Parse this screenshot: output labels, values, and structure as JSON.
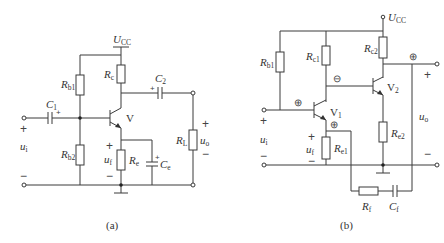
{
  "figure_a": {
    "caption": "(a)",
    "supply": {
      "main": "U",
      "sub": "CC"
    },
    "transistor": "V",
    "resistors": {
      "rb1": {
        "main": "R",
        "sub": "b1"
      },
      "rb2": {
        "main": "R",
        "sub": "b2"
      },
      "rc": {
        "main": "R",
        "sub": "c"
      },
      "re": {
        "main": "R",
        "sub": "e"
      },
      "rl": {
        "main": "R",
        "sub": "L"
      }
    },
    "capacitors": {
      "c1": {
        "main": "C",
        "sub": "1"
      },
      "c2": {
        "main": "C",
        "sub": "2"
      },
      "ce": {
        "main": "C",
        "sub": "e"
      }
    },
    "voltages": {
      "ui": {
        "main": "u",
        "sub": "i"
      },
      "uf": {
        "main": "u",
        "sub": "f"
      },
      "uo": {
        "main": "u",
        "sub": "o"
      }
    },
    "signs": {
      "plus": "+",
      "minus": "−",
      "cap_plus": "+"
    }
  },
  "figure_b": {
    "caption": "(b)",
    "supply": {
      "main": "U",
      "sub": "CC"
    },
    "transistors": {
      "v1": {
        "main": "V",
        "sub": "1"
      },
      "v2": {
        "main": "V",
        "sub": "2"
      }
    },
    "resistors": {
      "rb1": {
        "main": "R",
        "sub": "b1"
      },
      "rc1": {
        "main": "R",
        "sub": "c1"
      },
      "rc2": {
        "main": "R",
        "sub": "c2"
      },
      "re1": {
        "main": "R",
        "sub": "e1"
      },
      "re2": {
        "main": "R",
        "sub": "e2"
      },
      "rf": {
        "main": "R",
        "sub": "f"
      }
    },
    "capacitors": {
      "cf": {
        "main": "C",
        "sub": "f"
      }
    },
    "voltages": {
      "ui": {
        "main": "u",
        "sub": "i"
      },
      "uf": {
        "main": "u",
        "sub": "f"
      },
      "uo": {
        "main": "u",
        "sub": "o"
      }
    },
    "polarity_marks": {
      "v1_base": "⊕",
      "v1_collector": "⊖",
      "v1_emitter": "⊕",
      "output": "⊕"
    },
    "signs": {
      "plus": "+",
      "minus": "−"
    }
  }
}
